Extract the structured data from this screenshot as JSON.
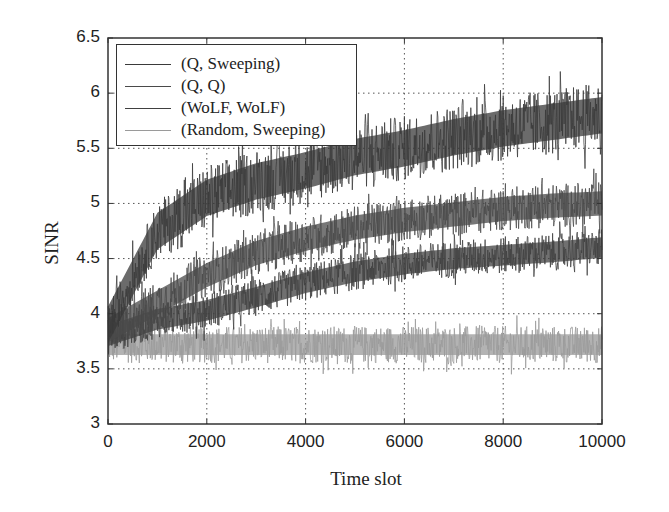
{
  "chart_data": {
    "type": "line",
    "title": "",
    "xlabel": "Time slot",
    "ylabel": "SINR",
    "xlim": [
      0,
      10000
    ],
    "ylim": [
      3,
      6.5
    ],
    "xticks": [
      "0",
      "2000",
      "4000",
      "6000",
      "8000",
      "10000"
    ],
    "yticks": [
      "3",
      "3.5",
      "4",
      "4.5",
      "5",
      "5.5",
      "6",
      "6.5"
    ],
    "grid": true,
    "legend_position": "upper left",
    "x": [
      0,
      1000,
      2000,
      3000,
      4000,
      5000,
      6000,
      7000,
      8000,
      9000,
      10000
    ],
    "series": [
      {
        "name": "(Q, Sweeping)",
        "color": "#3a3a3a",
        "values": [
          3.9,
          4.75,
          5.05,
          5.2,
          5.3,
          5.42,
          5.5,
          5.6,
          5.68,
          5.74,
          5.8
        ],
        "noise_halfwidth": 0.3
      },
      {
        "name": "(Q, Q)",
        "color": "#4a4a4a",
        "values": [
          3.85,
          4.1,
          4.35,
          4.55,
          4.68,
          4.78,
          4.85,
          4.9,
          4.95,
          4.98,
          5.0
        ],
        "noise_halfwidth": 0.2
      },
      {
        "name": "(WoLF, WoLF)",
        "color": "#404040",
        "values": [
          3.8,
          3.95,
          4.03,
          4.15,
          4.28,
          4.38,
          4.45,
          4.5,
          4.53,
          4.56,
          4.6
        ],
        "noise_halfwidth": 0.17
      },
      {
        "name": "(Random, Sweeping)",
        "color": "#9a9a9a",
        "values": [
          3.72,
          3.72,
          3.72,
          3.72,
          3.72,
          3.72,
          3.72,
          3.72,
          3.72,
          3.72,
          3.72
        ],
        "noise_halfwidth": 0.17
      }
    ]
  }
}
